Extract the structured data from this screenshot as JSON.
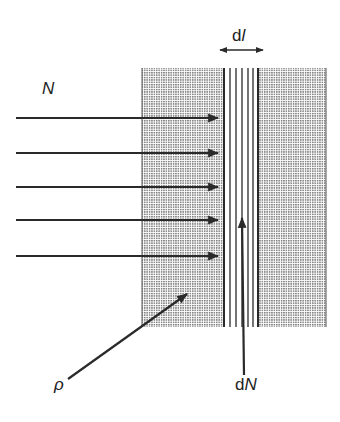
{
  "diagram": {
    "labels": {
      "incident_beam": "N",
      "thickness_prefix": "d",
      "thickness_var": "l",
      "density": "ρ",
      "absorbed_prefix": "d",
      "absorbed_var": "N"
    },
    "colors": {
      "ink": "#2a2a2a",
      "shading": "#9a9a9a",
      "background": "#ffffff"
    },
    "slab": {
      "x_left": 142,
      "x_right": 326,
      "y_top": 68,
      "y_bottom": 327,
      "thin_layer_x_start": 224,
      "thin_layer_x_end": 258
    },
    "incident_arrows_y": [
      118,
      153,
      187,
      220,
      256
    ],
    "thin_layer_lines_x": [
      224,
      230,
      236,
      242,
      248,
      253,
      258
    ]
  }
}
